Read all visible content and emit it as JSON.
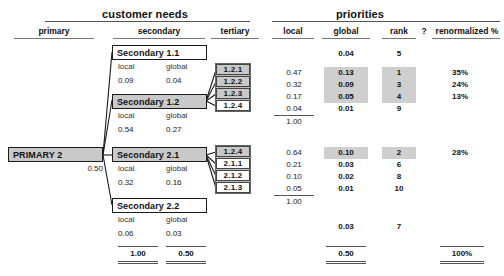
{
  "sections": {
    "customer_needs": "customer needs",
    "priorities": "priorities"
  },
  "columns": {
    "primary": "primary",
    "secondary": "secondary",
    "tertiary": "tertiary",
    "local": "local",
    "global": "global",
    "rank": "rank",
    "question": "?",
    "renormalized": "renormalized %"
  },
  "labels": {
    "local": "local",
    "global": "global"
  },
  "primary": {
    "label": "PRIMARY 2",
    "weight": "0.50"
  },
  "secondary_nodes": [
    {
      "label": "Secondary 1.1",
      "local": "0.09",
      "global": "0.04",
      "shaded": false
    },
    {
      "label": "Secondary 1.2",
      "local": "0.54",
      "global": "0.27",
      "shaded": true
    },
    {
      "label": "Secondary 2.1",
      "local": "0.32",
      "global": "0.16",
      "shaded": true
    },
    {
      "label": "Secondary 2.2",
      "local": "0.06",
      "global": "0.03",
      "shaded": false
    }
  ],
  "secondary_totals": {
    "local": "1.00",
    "global": "0.50"
  },
  "tertiary_group_1": [
    {
      "label": "1.2.1",
      "shaded": true
    },
    {
      "label": "1.2.2",
      "shaded": true
    },
    {
      "label": "1.2.3",
      "shaded": true
    },
    {
      "label": "1.2.4",
      "shaded": false
    }
  ],
  "tertiary_group_2": [
    {
      "label": "1.2.4",
      "shaded": true
    },
    {
      "label": "2.1.1",
      "shaded": false
    },
    {
      "label": "2.1.2",
      "shaded": false
    },
    {
      "label": "2.1.3",
      "shaded": false
    }
  ],
  "priority_rows": {
    "secondary_1_1": {
      "local": "",
      "global": "0.04",
      "rank": "5",
      "renorm": ""
    },
    "group_1": [
      {
        "local": "0.47",
        "global": "0.13",
        "rank": "1",
        "renorm": "35%",
        "highlight": true
      },
      {
        "local": "0.32",
        "global": "0.09",
        "rank": "3",
        "renorm": "24%",
        "highlight": true
      },
      {
        "local": "0.17",
        "global": "0.05",
        "rank": "4",
        "renorm": "13%",
        "highlight": true
      },
      {
        "local": "0.04",
        "global": "0.01",
        "rank": "9",
        "renorm": "",
        "highlight": false
      }
    ],
    "group_1_total": "1.00",
    "group_2": [
      {
        "local": "0.64",
        "global": "0.10",
        "rank": "2",
        "renorm": "28%",
        "highlight": true
      },
      {
        "local": "0.21",
        "global": "0.03",
        "rank": "6",
        "renorm": "",
        "highlight": false
      },
      {
        "local": "0.10",
        "global": "0.02",
        "rank": "8",
        "renorm": "",
        "highlight": false
      },
      {
        "local": "0.05",
        "global": "0.01",
        "rank": "10",
        "renorm": "",
        "highlight": false
      }
    ],
    "group_2_total": "1.00",
    "secondary_2_2": {
      "global": "0.03",
      "rank": "7"
    },
    "global_total": "0.50",
    "renorm_total": "100%"
  }
}
